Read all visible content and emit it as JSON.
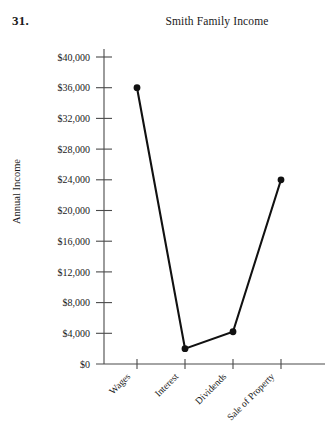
{
  "problem": {
    "number": "31."
  },
  "chart_data": {
    "type": "line",
    "title": "Smith Family Income",
    "xlabel": "",
    "ylabel": "Annual Income",
    "categories": [
      "Wages",
      "Interest",
      "Dividends",
      "Sale of Property"
    ],
    "values": [
      36000,
      2000,
      4200,
      24000
    ],
    "ylim": [
      0,
      40000
    ],
    "ytick_values": [
      0,
      4000,
      8000,
      12000,
      16000,
      20000,
      24000,
      28000,
      32000,
      36000,
      40000
    ],
    "ytick_labels": [
      "$0",
      "$4,000",
      "$8,000",
      "$12,000",
      "$16,000",
      "$20,000",
      "$24,000",
      "$28,000",
      "$32,000",
      "$36,000",
      "$40,000"
    ],
    "grid": false,
    "legend": "none",
    "marker": "filled-circle",
    "line_color": "#111111",
    "axis_color": "#4a4a4a"
  }
}
